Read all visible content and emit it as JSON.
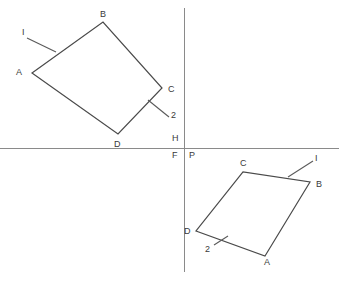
{
  "figure": {
    "width": 339,
    "height": 281,
    "background_color": "#ffffff",
    "line_color": "#4a4a4a",
    "axis_color": "#8a8a8a",
    "label_color": "#3a3a3a"
  },
  "axes": {
    "horizontal": {
      "name": "horizontal-reference-line",
      "x1": 0,
      "y1": 148,
      "x2": 339,
      "y2": 148
    },
    "vertical": {
      "name": "vertical-reference-line",
      "x1": 184,
      "y1": 8,
      "x2": 184,
      "y2": 272
    },
    "origin_labels": [
      {
        "text": "H",
        "x": 172,
        "y": 134
      },
      {
        "text": "F",
        "x": 172,
        "y": 151
      },
      {
        "text": "P",
        "x": 189,
        "y": 151
      }
    ]
  },
  "shapes": [
    {
      "name": "upper-left-quadrilateral",
      "vertices": [
        {
          "label": "A",
          "x": 32,
          "y": 73,
          "label_x": 16,
          "label_y": 68
        },
        {
          "label": "B",
          "x": 103,
          "y": 22,
          "label_x": 100,
          "label_y": 10
        },
        {
          "label": "C",
          "x": 162,
          "y": 88,
          "label_x": 168,
          "label_y": 85
        },
        {
          "label": "D",
          "x": 118,
          "y": 134,
          "label_x": 114,
          "label_y": 140
        }
      ],
      "annotations": [
        {
          "text": "I",
          "label_x": 22,
          "label_y": 28,
          "tick": {
            "x1": 27,
            "y1": 38,
            "x2": 56,
            "y2": 52
          }
        },
        {
          "text": "2",
          "label_x": 171,
          "label_y": 111,
          "tick": {
            "x1": 169,
            "y1": 117,
            "x2": 148,
            "y2": 100
          }
        }
      ]
    },
    {
      "name": "lower-right-quadrilateral",
      "vertices": [
        {
          "label": "A",
          "x": 265,
          "y": 256,
          "label_x": 264,
          "label_y": 258
        },
        {
          "label": "B",
          "x": 310,
          "y": 182,
          "label_x": 316,
          "label_y": 180
        },
        {
          "label": "C",
          "x": 243,
          "y": 172,
          "label_x": 240,
          "label_y": 159
        },
        {
          "label": "D",
          "x": 196,
          "y": 231,
          "label_x": 184,
          "label_y": 227
        }
      ],
      "annotations": [
        {
          "text": "I",
          "label_x": 315,
          "label_y": 154,
          "tick": {
            "x1": 313,
            "y1": 161,
            "x2": 288,
            "y2": 177
          }
        },
        {
          "text": "2",
          "label_x": 205,
          "label_y": 245,
          "tick": {
            "x1": 214,
            "y1": 245,
            "x2": 228,
            "y2": 236
          }
        }
      ]
    }
  ]
}
